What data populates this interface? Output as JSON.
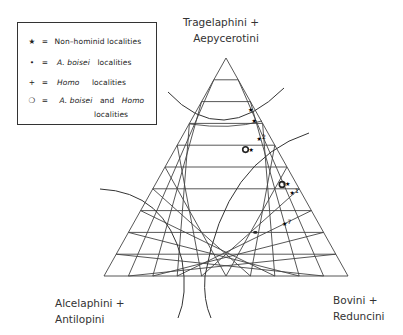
{
  "legend": {
    "items": [
      {
        "symbol": "★",
        "symbol_name": "star-icon",
        "eq": "=",
        "text": "Non–hominid  localities",
        "italic": ""
      },
      {
        "symbol": "•",
        "symbol_name": "dot-icon",
        "eq": "=",
        "italic": "A. boisei",
        "text": "localities"
      },
      {
        "symbol": "+",
        "symbol_name": "plus-icon",
        "eq": "=",
        "italic": "Homo",
        "text": "localities"
      },
      {
        "symbol": "❍",
        "symbol_name": "circle-icon",
        "eq": "=",
        "italic": "A. boisei",
        "text": "and",
        "italic2": "Homo",
        "text2": "localities"
      }
    ]
  },
  "vertices": {
    "top": [
      "Tragelaphini  +",
      "Aepycerotini"
    ],
    "left": [
      "Alcelaphini  +",
      "Antilopini"
    ],
    "right": [
      "Bovini  +",
      "Reduncini"
    ]
  },
  "grid_divisions": 10,
  "points": [
    {
      "type": "star",
      "label": "",
      "top": 0.76,
      "right": 0.22
    },
    {
      "type": "star",
      "label": "",
      "top": 0.71,
      "right": 0.26
    },
    {
      "type": "star",
      "label": "2",
      "top": 0.63,
      "right": 0.32
    },
    {
      "type": "circle",
      "label": "",
      "top": 0.58,
      "right": 0.29
    },
    {
      "type": "circle",
      "label": "",
      "top": 0.42,
      "right": 0.52
    },
    {
      "type": "star",
      "label": "1",
      "top": 0.38,
      "right": 0.58
    },
    {
      "type": "star",
      "label": "7",
      "top": 0.24,
      "right": 0.62
    },
    {
      "type": "dot",
      "label": "",
      "top": 0.2,
      "right": 0.52
    }
  ],
  "colors": {
    "line": "#333333",
    "grid": "#444444"
  }
}
